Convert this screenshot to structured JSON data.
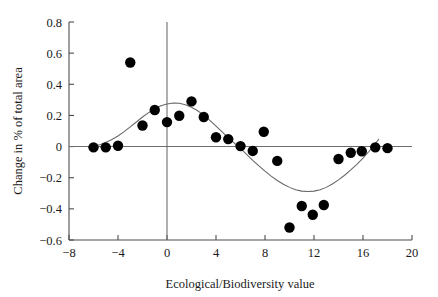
{
  "chart_data": {
    "type": "scatter",
    "title": "",
    "xlabel": "Ecological/Biodiversity value",
    "ylabel": "Change in % of total area",
    "xlim": [
      -8,
      20
    ],
    "ylim": [
      -0.6,
      0.8
    ],
    "xticks": [
      -8,
      -4,
      0,
      4,
      8,
      12,
      16,
      20
    ],
    "xtick_labels": [
      "−8",
      "−4",
      "0",
      "4",
      "8",
      "12",
      "16",
      "20"
    ],
    "yticks": [
      -0.6,
      -0.4,
      -0.2,
      0,
      0.2,
      0.4,
      0.6,
      0.8
    ],
    "ytick_labels": [
      "−0.6",
      "−0.4",
      "−0.2",
      "0",
      "0.2",
      "0.4",
      "0.6",
      "0.8"
    ],
    "grid": false,
    "legend": null,
    "marker_color": "#000000",
    "marker_size": 5.2,
    "trend_color": "#555555",
    "zero_line_y": 0,
    "zero_line_x": 0,
    "points": [
      {
        "x": -6.0,
        "y": -0.005
      },
      {
        "x": -5.0,
        "y": -0.005
      },
      {
        "x": -4.0,
        "y": 0.005
      },
      {
        "x": -3.0,
        "y": 0.54
      },
      {
        "x": -2.0,
        "y": 0.135
      },
      {
        "x": -1.0,
        "y": 0.235
      },
      {
        "x": 0.0,
        "y": 0.157
      },
      {
        "x": 1.0,
        "y": 0.198
      },
      {
        "x": 2.0,
        "y": 0.29
      },
      {
        "x": 3.0,
        "y": 0.19
      },
      {
        "x": 4.0,
        "y": 0.06
      },
      {
        "x": 5.0,
        "y": 0.048
      },
      {
        "x": 6.0,
        "y": 0.003
      },
      {
        "x": 7.0,
        "y": -0.028
      },
      {
        "x": 7.9,
        "y": 0.095
      },
      {
        "x": 9.0,
        "y": -0.092
      },
      {
        "x": 10.0,
        "y": -0.52
      },
      {
        "x": 11.0,
        "y": -0.382
      },
      {
        "x": 11.9,
        "y": -0.438
      },
      {
        "x": 12.8,
        "y": -0.375
      },
      {
        "x": 14.0,
        "y": -0.08
      },
      {
        "x": 15.0,
        "y": -0.04
      },
      {
        "x": 15.9,
        "y": -0.03
      },
      {
        "x": 17.0,
        "y": -0.005
      },
      {
        "x": 18.0,
        "y": -0.01
      }
    ],
    "trend_line": [
      {
        "x": -6.2,
        "y": 0.0
      },
      {
        "x": -5.5,
        "y": 0.012
      },
      {
        "x": -5.0,
        "y": 0.026
      },
      {
        "x": -4.5,
        "y": 0.045
      },
      {
        "x": -4.0,
        "y": 0.068
      },
      {
        "x": -3.5,
        "y": 0.096
      },
      {
        "x": -3.0,
        "y": 0.126
      },
      {
        "x": -2.5,
        "y": 0.158
      },
      {
        "x": -2.0,
        "y": 0.19
      },
      {
        "x": -1.5,
        "y": 0.218
      },
      {
        "x": -1.0,
        "y": 0.243
      },
      {
        "x": -0.5,
        "y": 0.262
      },
      {
        "x": 0.0,
        "y": 0.274
      },
      {
        "x": 0.5,
        "y": 0.28
      },
      {
        "x": 1.0,
        "y": 0.278
      },
      {
        "x": 1.5,
        "y": 0.268
      },
      {
        "x": 2.0,
        "y": 0.252
      },
      {
        "x": 2.5,
        "y": 0.23
      },
      {
        "x": 3.0,
        "y": 0.202
      },
      {
        "x": 3.5,
        "y": 0.168
      },
      {
        "x": 4.0,
        "y": 0.132
      },
      {
        "x": 4.5,
        "y": 0.094
      },
      {
        "x": 5.0,
        "y": 0.056
      },
      {
        "x": 5.5,
        "y": 0.022
      },
      {
        "x": 6.0,
        "y": -0.012
      },
      {
        "x": 6.5,
        "y": -0.05
      },
      {
        "x": 7.0,
        "y": -0.088
      },
      {
        "x": 7.5,
        "y": -0.124
      },
      {
        "x": 8.0,
        "y": -0.158
      },
      {
        "x": 8.5,
        "y": -0.19
      },
      {
        "x": 9.0,
        "y": -0.218
      },
      {
        "x": 9.5,
        "y": -0.242
      },
      {
        "x": 10.0,
        "y": -0.262
      },
      {
        "x": 10.5,
        "y": -0.277
      },
      {
        "x": 11.0,
        "y": -0.286
      },
      {
        "x": 11.5,
        "y": -0.289
      },
      {
        "x": 12.0,
        "y": -0.286
      },
      {
        "x": 12.5,
        "y": -0.277
      },
      {
        "x": 13.0,
        "y": -0.262
      },
      {
        "x": 13.5,
        "y": -0.24
      },
      {
        "x": 14.0,
        "y": -0.214
      },
      {
        "x": 14.5,
        "y": -0.184
      },
      {
        "x": 15.0,
        "y": -0.15
      },
      {
        "x": 15.5,
        "y": -0.114
      },
      {
        "x": 16.0,
        "y": -0.074
      },
      {
        "x": 16.5,
        "y": -0.03
      },
      {
        "x": 17.0,
        "y": 0.018
      },
      {
        "x": 17.3,
        "y": 0.048
      }
    ]
  }
}
